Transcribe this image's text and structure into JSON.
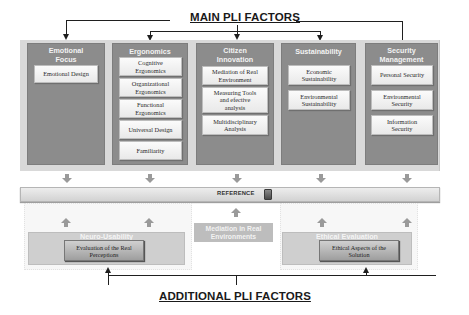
{
  "main_title": "MAIN PLI FACTORS",
  "additional_title": "ADDITIONAL PLI FACTORS",
  "main_factors": [
    {
      "label": "Emotional Focus",
      "items": [
        "Emotional Design"
      ]
    },
    {
      "label": "Ergonomics",
      "items": [
        "Cognitive Ergonomics",
        "Organizational Ergonomics",
        "Functional Ergonomics",
        "Universal Design",
        "Familiarity"
      ]
    },
    {
      "label": "Citizen Innovation",
      "items": [
        "Mediation of Real Environment",
        "Measuring Tools and efective analysis",
        "Multidisciplinary Analysis"
      ]
    },
    {
      "label": "Sustainability",
      "items": [
        "Economic Sustainability",
        "Environmental Sustainability"
      ]
    },
    {
      "label": "Security Management",
      "items": [
        "Personal Security",
        "Environmental Security",
        "Information Security"
      ]
    }
  ],
  "reference": {
    "label": "REFERENCE",
    "icon": "book-icon"
  },
  "additional_factors": [
    {
      "label": "Neuro-Usability",
      "items": [
        "Evaluation of the Real Perceptions"
      ]
    },
    {
      "label": "Mediation in Real Environments",
      "items": []
    },
    {
      "label": "Ethical Evaluation",
      "items": [
        "Ethical Aspects of the Solution"
      ]
    }
  ],
  "colors": {
    "column_fill": "#8c8c8c",
    "outer_panel": "#d9d9d9",
    "item_fill": "#f4f4f4",
    "additional_box": "#cfcfcf",
    "line": "#1f1f1f"
  }
}
